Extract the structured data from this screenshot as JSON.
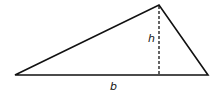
{
  "diagram": {
    "type": "triangle",
    "vertices": {
      "left": [
        15,
        75
      ],
      "apex": [
        159,
        5
      ],
      "right": [
        208,
        75
      ]
    },
    "height_foot": [
      159,
      75
    ],
    "labels": {
      "height": "h",
      "base": "b"
    },
    "colors": {
      "stroke": "#111111",
      "background": "#ffffff"
    }
  }
}
